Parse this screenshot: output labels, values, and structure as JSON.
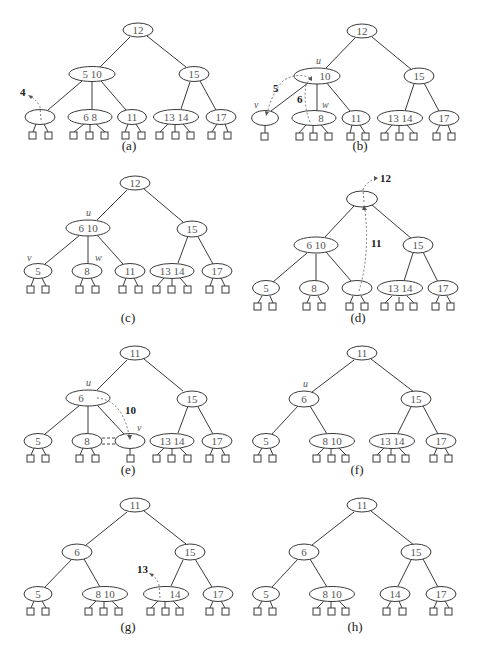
{
  "figure": {
    "colors": {
      "stroke": "#3a3a3a",
      "key_text": "#555555",
      "dashed_arrow": "#6a6a6a",
      "background": "#ffffff"
    },
    "panels": [
      {
        "id": "a",
        "caption": "(a)",
        "root": {
          "keys": "12"
        },
        "level1": [
          {
            "keys": "5 10"
          },
          {
            "keys": "15"
          }
        ],
        "level2": [
          {
            "keys": "",
            "parent": 0,
            "leaves": 2
          },
          {
            "keys": "6 8",
            "parent": 0,
            "leaves": 3
          },
          {
            "keys": "11",
            "parent": 0,
            "leaves": 2
          },
          {
            "keys": "13 14",
            "parent": 1,
            "leaves": 3
          },
          {
            "keys": "17",
            "parent": 1,
            "leaves": 2
          }
        ],
        "annotations": [
          {
            "type": "removed-key",
            "text": "4"
          }
        ]
      },
      {
        "id": "b",
        "caption": "(b)",
        "root": {
          "keys": "12"
        },
        "level1": [
          {
            "keys": "10",
            "label": "u"
          },
          {
            "keys": "15"
          }
        ],
        "level2": [
          {
            "keys": "",
            "label": "v",
            "parent": 0,
            "leaves": 1
          },
          {
            "keys": "8",
            "label": "w",
            "parent": 0,
            "leaves": 3
          },
          {
            "keys": "11",
            "parent": 0,
            "leaves": 2
          },
          {
            "keys": "13 14",
            "parent": 1,
            "leaves": 3
          },
          {
            "keys": "17",
            "parent": 1,
            "leaves": 2
          }
        ],
        "annotations": [
          {
            "type": "transfer-arrow",
            "text": "5"
          },
          {
            "type": "transfer-arrow",
            "text": "6"
          }
        ]
      },
      {
        "id": "c",
        "caption": "(c)",
        "root": {
          "keys": "12"
        },
        "level1": [
          {
            "keys": "6 10",
            "label": "u"
          },
          {
            "keys": "15"
          }
        ],
        "level2": [
          {
            "keys": "5",
            "label": "v",
            "parent": 0,
            "leaves": 2
          },
          {
            "keys": "8",
            "label": "w",
            "parent": 0,
            "leaves": 2
          },
          {
            "keys": "11",
            "parent": 0,
            "leaves": 2
          },
          {
            "keys": "13 14",
            "parent": 1,
            "leaves": 3
          },
          {
            "keys": "17",
            "parent": 1,
            "leaves": 2
          }
        ],
        "annotations": []
      },
      {
        "id": "d",
        "caption": "(d)",
        "root": {
          "keys": ""
        },
        "level1": [
          {
            "keys": "6 10"
          },
          {
            "keys": "15"
          }
        ],
        "level2": [
          {
            "keys": "5",
            "parent": 0,
            "leaves": 2
          },
          {
            "keys": "8",
            "parent": 0,
            "leaves": 2
          },
          {
            "keys": "",
            "parent": 0,
            "leaves": 2
          },
          {
            "keys": "13 14",
            "parent": 1,
            "leaves": 3
          },
          {
            "keys": "17",
            "parent": 1,
            "leaves": 2
          }
        ],
        "annotations": [
          {
            "type": "removed-key",
            "text": "12"
          },
          {
            "type": "swap-arrow",
            "text": "11"
          }
        ]
      },
      {
        "id": "e",
        "caption": "(e)",
        "root": {
          "keys": "11"
        },
        "level1": [
          {
            "keys": "6",
            "label": "u"
          },
          {
            "keys": "15"
          }
        ],
        "level2": [
          {
            "keys": "5",
            "parent": 0,
            "leaves": 2
          },
          {
            "keys": "8",
            "parent": 0,
            "leaves": 2
          },
          {
            "keys": "",
            "label": "v",
            "parent": 0,
            "leaves": 1
          },
          {
            "keys": "13 14",
            "parent": 1,
            "leaves": 3
          },
          {
            "keys": "17",
            "parent": 1,
            "leaves": 2
          }
        ],
        "annotations": [
          {
            "type": "fusion-arrow",
            "text": "10"
          }
        ]
      },
      {
        "id": "f",
        "caption": "(f)",
        "root": {
          "keys": "11"
        },
        "level1": [
          {
            "keys": "6",
            "label": "u"
          },
          {
            "keys": "15"
          }
        ],
        "level2": [
          {
            "keys": "5",
            "parent": 0,
            "leaves": 2
          },
          {
            "keys": "8 10",
            "parent": 0,
            "leaves": 3
          },
          {
            "keys": "13 14",
            "parent": 1,
            "leaves": 3
          },
          {
            "keys": "17",
            "parent": 1,
            "leaves": 2
          }
        ],
        "annotations": []
      },
      {
        "id": "g",
        "caption": "(g)",
        "root": {
          "keys": "11"
        },
        "level1": [
          {
            "keys": "6"
          },
          {
            "keys": "15"
          }
        ],
        "level2": [
          {
            "keys": "5",
            "parent": 0,
            "leaves": 2
          },
          {
            "keys": "8 10",
            "parent": 0,
            "leaves": 3
          },
          {
            "keys": "14",
            "parent": 1,
            "leaves": 3
          },
          {
            "keys": "17",
            "parent": 1,
            "leaves": 2
          }
        ],
        "annotations": [
          {
            "type": "removed-key",
            "text": "13"
          }
        ]
      },
      {
        "id": "h",
        "caption": "(h)",
        "root": {
          "keys": "11"
        },
        "level1": [
          {
            "keys": "6"
          },
          {
            "keys": "15"
          }
        ],
        "level2": [
          {
            "keys": "5",
            "parent": 0,
            "leaves": 2
          },
          {
            "keys": "8 10",
            "parent": 0,
            "leaves": 3
          },
          {
            "keys": "14",
            "parent": 1,
            "leaves": 2
          },
          {
            "keys": "17",
            "parent": 1,
            "leaves": 2
          }
        ],
        "annotations": []
      }
    ]
  }
}
